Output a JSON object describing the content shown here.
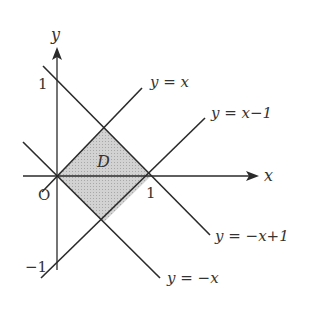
{
  "diagram": {
    "type": "coordinate-region",
    "axes": {
      "x_label": "x",
      "y_label": "y",
      "origin_label": "O"
    },
    "ticks": {
      "x_one": "1",
      "y_one": "1",
      "y_minus_one": "−1"
    },
    "region": {
      "label": "D",
      "fill": "#c8c8c8",
      "vertices": [
        [
          0,
          0
        ],
        [
          0.5,
          0.5
        ],
        [
          1,
          0
        ],
        [
          0.5,
          -0.5
        ]
      ]
    },
    "lines": [
      {
        "id": "l1",
        "label": "y = x"
      },
      {
        "id": "l2",
        "label": "y = x−1"
      },
      {
        "id": "l3",
        "label": "y = −x+1"
      },
      {
        "id": "l4",
        "label": "y = −x"
      }
    ],
    "colors": {
      "stroke": "#2a2a2a",
      "text": "#333333",
      "shade": "#c8c8c8"
    }
  }
}
